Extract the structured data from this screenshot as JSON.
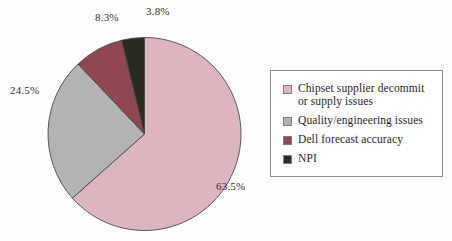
{
  "chart_data": {
    "type": "pie",
    "title": "",
    "subtitle": "",
    "xlabel": "",
    "ylabel": "",
    "grid": false,
    "legend_position": "right",
    "start_angle_deg": 0,
    "direction": "clockwise",
    "categories": [
      "Chipset supplier decommit or supply issues",
      "Quality/engineering issues",
      "Dell forecast accuracy",
      "NPI"
    ],
    "values": [
      63.5,
      24.5,
      8.3,
      3.8
    ],
    "value_labels": [
      "63.5%",
      "24.5%",
      "8.3%",
      "3.8%"
    ],
    "units": "percent",
    "colors": [
      "#dcb5bf",
      "#b3b3b3",
      "#8f4850",
      "#2a2a22"
    ],
    "slices": [
      {
        "label": "Chipset supplier decommit or supply issues",
        "value": 63.5,
        "value_label": "63.5%",
        "color": "#dcb5bf"
      },
      {
        "label": "Quality/engineering issues",
        "value": 24.5,
        "value_label": "24.5%",
        "color": "#b3b3b3"
      },
      {
        "label": "Dell forecast accuracy",
        "value": 8.3,
        "value_label": "8.3%",
        "color": "#8f4850"
      },
      {
        "label": "NPI",
        "value": 3.8,
        "value_label": "3.8%",
        "color": "#2a2a22"
      }
    ]
  },
  "pie_labels": {
    "chipset": "63.5%",
    "quality": "24.5%",
    "dell": "8.3%",
    "npi": "3.8%"
  },
  "legend": {
    "items": [
      {
        "line1": "Chipset supplier decommit",
        "line2": "or supply issues",
        "color": "#dcb5bf"
      },
      {
        "line1": "Quality/engineering issues",
        "line2": "",
        "color": "#b3b3b3"
      },
      {
        "line1": "Dell forecast accuracy",
        "line2": "",
        "color": "#8f4850"
      },
      {
        "line1": "NPI",
        "line2": "",
        "color": "#2a2a22"
      }
    ]
  },
  "style": {
    "background": "#fdfdfd",
    "slice_outline": "#4a4a4a",
    "legend_border": "#8b8b8b",
    "label_color": "#2e2e2e"
  }
}
